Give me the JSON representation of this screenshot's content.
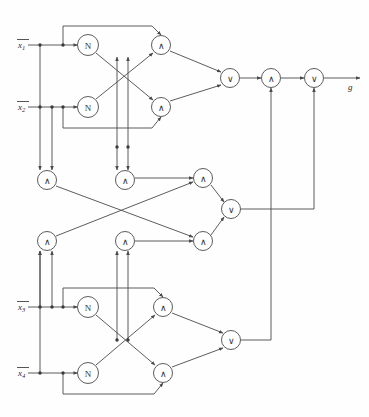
{
  "figure": {
    "kind": "boolean-circuit-diagram",
    "background": "#fefefe",
    "wire_color": "#4a4a4a",
    "text_color": "#2b2b2b"
  },
  "inputs": [
    {
      "id": "x1",
      "base": "x",
      "sub": "1",
      "overline": true,
      "x": 18,
      "y": 48,
      "line_y": 45,
      "line_x_end": 88
    },
    {
      "id": "x2",
      "base": "x",
      "sub": "2",
      "overline": true,
      "x": 18,
      "y": 110,
      "line_y": 107,
      "line_x_end": 88
    },
    {
      "id": "x3",
      "base": "x",
      "sub": "3",
      "overline": true,
      "x": 18,
      "y": 310,
      "line_y": 307,
      "line_x_end": 88
    },
    {
      "id": "x4",
      "base": "x",
      "sub": "4",
      "overline": true,
      "x": 18,
      "y": 376,
      "line_y": 373,
      "line_x_end": 88
    }
  ],
  "output": {
    "id": "g",
    "label": "g",
    "x": 348,
    "y": 90,
    "wire_from_x": 324,
    "wire_to_x": 362,
    "wire_y": 78
  },
  "gate_symbols": {
    "not": "N",
    "and": "∧",
    "or": "∨"
  },
  "gates": [
    {
      "id": "n-top-1",
      "type": "not",
      "symbol": "N",
      "cx": 88,
      "cy": 45,
      "r": 10.5
    },
    {
      "id": "n-top-2",
      "type": "not",
      "symbol": "N",
      "cx": 88,
      "cy": 107,
      "r": 10.5
    },
    {
      "id": "and-top-1",
      "type": "and",
      "symbol": "∧",
      "cx": 161,
      "cy": 45,
      "r": 9.5
    },
    {
      "id": "and-top-2",
      "type": "and",
      "symbol": "∧",
      "cx": 161,
      "cy": 107,
      "r": 9.5
    },
    {
      "id": "or-top",
      "type": "or",
      "symbol": "∨",
      "cx": 230,
      "cy": 78,
      "r": 9.5
    },
    {
      "id": "and-out",
      "type": "and",
      "symbol": "∧",
      "cx": 271,
      "cy": 78,
      "r": 9.5
    },
    {
      "id": "or-out",
      "type": "or",
      "symbol": "∨",
      "cx": 314,
      "cy": 78,
      "r": 9.5
    },
    {
      "id": "and-mid-a",
      "type": "and",
      "symbol": "∧",
      "cx": 47,
      "cy": 180,
      "r": 9.5
    },
    {
      "id": "and-mid-b",
      "type": "and",
      "symbol": "∧",
      "cx": 125,
      "cy": 180,
      "r": 9.5
    },
    {
      "id": "and-mid-c",
      "type": "and",
      "symbol": "∧",
      "cx": 203,
      "cy": 178,
      "r": 9.5
    },
    {
      "id": "or-mid",
      "type": "or",
      "symbol": "∨",
      "cx": 231,
      "cy": 209,
      "r": 9.5
    },
    {
      "id": "and-mid-d",
      "type": "and",
      "symbol": "∧",
      "cx": 47,
      "cy": 241,
      "r": 9.5
    },
    {
      "id": "and-mid-e",
      "type": "and",
      "symbol": "∧",
      "cx": 125,
      "cy": 241,
      "r": 9.5
    },
    {
      "id": "and-mid-f",
      "type": "and",
      "symbol": "∧",
      "cx": 203,
      "cy": 241,
      "r": 9.5
    },
    {
      "id": "n-bot-1",
      "type": "not",
      "symbol": "N",
      "cx": 88,
      "cy": 307,
      "r": 10.5
    },
    {
      "id": "n-bot-2",
      "type": "not",
      "symbol": "N",
      "cx": 88,
      "cy": 373,
      "r": 10.5
    },
    {
      "id": "and-bot-1",
      "type": "and",
      "symbol": "∧",
      "cx": 163,
      "cy": 307,
      "r": 9.5
    },
    {
      "id": "and-bot-2",
      "type": "and",
      "symbol": "∧",
      "cx": 163,
      "cy": 373,
      "r": 9.5
    },
    {
      "id": "or-bot",
      "type": "or",
      "symbol": "∨",
      "cx": 231,
      "cy": 340,
      "r": 9.5
    }
  ],
  "junctions": [
    {
      "x": 40,
      "y": 45
    },
    {
      "x": 63,
      "y": 45
    },
    {
      "x": 40,
      "y": 107
    },
    {
      "x": 52,
      "y": 107
    },
    {
      "x": 63,
      "y": 107
    },
    {
      "x": 117,
      "y": 147
    },
    {
      "x": 128,
      "y": 147
    },
    {
      "x": 40,
      "y": 307
    },
    {
      "x": 52,
      "y": 307
    },
    {
      "x": 63,
      "y": 307
    },
    {
      "x": 40,
      "y": 373
    },
    {
      "x": 63,
      "y": 373
    },
    {
      "x": 117,
      "y": 340
    },
    {
      "x": 128,
      "y": 340
    }
  ],
  "wire_paths": [
    {
      "id": "x1-bus",
      "d": "M 28 45 L 77.5 45"
    },
    {
      "id": "x2-bus",
      "d": "M 28 107 L 77.5 107"
    },
    {
      "id": "x3-bus",
      "d": "M 28 307 L 77.5 307"
    },
    {
      "id": "x4-bus",
      "d": "M 28 373 L 77.5 373"
    },
    {
      "id": "x1-down-to-andmidA",
      "d": "M 40 45 L 40 170"
    },
    {
      "id": "x2-down-to-andmidA",
      "d": "M 52 107 L 52 170"
    },
    {
      "id": "x1-feedback-top",
      "d": "M 63 45 L 63 26 L 152 26 L 161 35"
    },
    {
      "id": "x2-feedback-top",
      "d": "M 63 107 L 63 128 L 152 128 L 161 117"
    },
    {
      "id": "nt1-to-andtop2",
      "d": "M 96 53 L 153 100"
    },
    {
      "id": "nt2-to-andtop1",
      "d": "M 96 99 L 153 53"
    },
    {
      "id": "tap-up-1",
      "d": "M 117 147 L 117 57"
    },
    {
      "id": "tap-up-2",
      "d": "M 128 147 L 128 57"
    },
    {
      "id": "tap-down-1",
      "d": "M 117 147 L 117 170"
    },
    {
      "id": "tap-down-2",
      "d": "M 128 147 L 128 170"
    },
    {
      "id": "andtop1-to-ortop",
      "d": "M 170 51 L 221 72"
    },
    {
      "id": "andtop2-to-ortop",
      "d": "M 170 101 L 221 85"
    },
    {
      "id": "ortop-to-andout",
      "d": "M 240 78 L 261 78"
    },
    {
      "id": "andout-to-orout",
      "d": "M 281 78 L 304 78"
    },
    {
      "id": "orout-to-g",
      "d": "M 324 78 L 360 78"
    },
    {
      "id": "andmidA-to-andmidF",
      "d": "M 56 186 L 193 237"
    },
    {
      "id": "andmidD-to-andmidC",
      "d": "M 56 236 L 193 182"
    },
    {
      "id": "andmidB-to-andmidC",
      "d": "M 135 178 L 193 178"
    },
    {
      "id": "andmidE-to-andmidF",
      "d": "M 135 241 L 193 241"
    },
    {
      "id": "andmidC-to-ormid",
      "d": "M 211 185 L 224 202"
    },
    {
      "id": "andmidF-to-ormid",
      "d": "M 211 235 L 224 217"
    },
    {
      "id": "ormid-right-up",
      "d": "M 241 209 L 314 209 L 314 88"
    },
    {
      "id": "orbot-right-up",
      "d": "M 241 340 L 271 340 L 271 88"
    },
    {
      "id": "x3-down-to-andmidD",
      "d": "M 40 307 L 40 251"
    },
    {
      "id": "x4-down-to-andmidD",
      "d": "M 52 307 L 52 251"
    },
    {
      "id": "x3-feedback-bot",
      "d": "M 63 307 L 63 288 L 154 288 L 163 297"
    },
    {
      "id": "x4-feedback-bot",
      "d": "M 63 373 L 63 394 L 154 394 L 163 383"
    },
    {
      "id": "nb1-to-andbot2",
      "d": "M 96 315 L 155 365"
    },
    {
      "id": "nb2-to-andbot1",
      "d": "M 96 365 L 155 315"
    },
    {
      "id": "tapb-up-1",
      "d": "M 117 340 L 117 251"
    },
    {
      "id": "tapb-up-2",
      "d": "M 128 340 L 128 251"
    },
    {
      "id": "andbot1-to-orbot",
      "d": "M 172 313 L 223 333"
    },
    {
      "id": "andbot2-to-orbot",
      "d": "M 172 367 L 223 348"
    },
    {
      "id": "x4-long-down",
      "d": "M 40 373 L 40 251"
    }
  ]
}
